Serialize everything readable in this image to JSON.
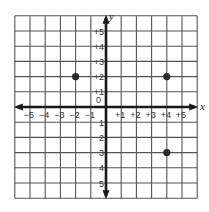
{
  "chart_data": {
    "type": "scatter",
    "title": "",
    "xlabel": "x",
    "ylabel": "y",
    "xlim": [
      -6,
      6
    ],
    "ylim": [
      -6,
      6
    ],
    "grid": true,
    "x_tick_labels": [
      "-5",
      "-4",
      "-3",
      "-2",
      "-1",
      "+1",
      "+2",
      "+3",
      "+4",
      "+5"
    ],
    "y_tick_labels": [
      "+5",
      "+4",
      "+3",
      "+2",
      "+1",
      "0",
      "-1",
      "-2",
      "-3",
      "-4",
      "-5"
    ],
    "points": [
      {
        "x": -2,
        "y": 2
      },
      {
        "x": 4,
        "y": 2
      },
      {
        "x": 4,
        "y": -3
      }
    ]
  },
  "axes": {
    "x_name": "x",
    "y_name": "y",
    "origin_label": "0",
    "x_ticks": [
      {
        "v": -5,
        "label": "−5"
      },
      {
        "v": -4,
        "label": "−4"
      },
      {
        "v": -3,
        "label": "−3"
      },
      {
        "v": -2,
        "label": "−2"
      },
      {
        "v": -1,
        "label": "−1"
      },
      {
        "v": 1,
        "label": "+1"
      },
      {
        "v": 2,
        "label": "+2"
      },
      {
        "v": 3,
        "label": "+3"
      },
      {
        "v": 4,
        "label": "+4"
      },
      {
        "v": 5,
        "label": "+5"
      }
    ],
    "y_ticks": [
      {
        "v": 5,
        "label": "+5"
      },
      {
        "v": 4,
        "label": "+4"
      },
      {
        "v": 3,
        "label": "+3"
      },
      {
        "v": 2,
        "label": "+2"
      },
      {
        "v": 1,
        "label": "+1"
      },
      {
        "v": -1,
        "label": "1"
      },
      {
        "v": -2,
        "label": "2"
      },
      {
        "v": -3,
        "label": "3"
      },
      {
        "v": -4,
        "label": "4"
      },
      {
        "v": -5,
        "label": "5"
      }
    ]
  },
  "colors": {
    "grid": "#555555",
    "axis": "#1a1a1a",
    "point": "#2a2a2a",
    "label": "#333333"
  }
}
